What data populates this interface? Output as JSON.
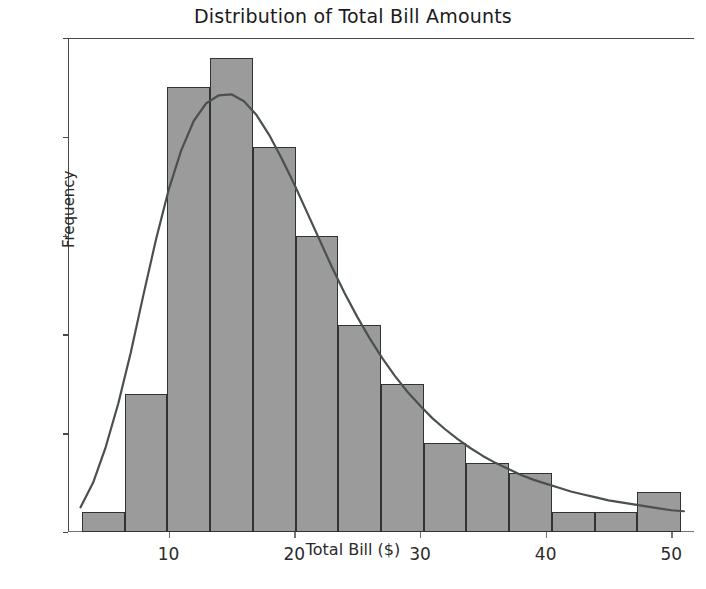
{
  "chart_data": {
    "type": "bar",
    "title": "Distribution of Total Bill Amounts",
    "xlabel": "Total Bill ($)",
    "ylabel": "Frequency",
    "xlim": [
      2.0,
      51.8
    ],
    "ylim": [
      0,
      50
    ],
    "grid": false,
    "legend": null,
    "x_ticks": [
      10,
      20,
      30,
      40,
      50
    ],
    "y_ticks": [
      0,
      10,
      20,
      30,
      40,
      50
    ],
    "bin_edges": [
      3.1,
      6.5,
      9.9,
      13.3,
      16.7,
      20.1,
      23.5,
      26.9,
      30.3,
      33.7,
      37.1,
      40.5,
      43.9,
      47.3,
      50.8
    ],
    "bin_centers": [
      4.8,
      8.2,
      11.6,
      15.0,
      18.4,
      21.8,
      25.2,
      28.6,
      32.0,
      35.4,
      38.8,
      42.2,
      45.6,
      49.0
    ],
    "values": [
      2,
      14,
      45,
      48,
      39,
      30,
      21,
      15,
      9,
      7,
      6,
      2,
      2,
      4
    ],
    "bar_facecolor": "#9b9b9b",
    "bar_edgecolor": "#2f3333",
    "kde": {
      "name": "density curve",
      "color": "#4a5050",
      "x": [
        3.0,
        4.0,
        5.0,
        6.0,
        7.0,
        8.0,
        9.0,
        10.0,
        11.0,
        12.0,
        13.0,
        14.0,
        15.0,
        16.0,
        17.0,
        18.0,
        19.0,
        20.0,
        21.0,
        22.0,
        23.0,
        24.0,
        25.0,
        26.0,
        27.0,
        28.0,
        29.0,
        30.0,
        31.0,
        32.0,
        33.0,
        34.0,
        35.0,
        36.0,
        37.0,
        38.0,
        39.0,
        40.0,
        41.0,
        42.0,
        43.0,
        44.0,
        45.0,
        46.0,
        47.0,
        48.0,
        49.0,
        50.0,
        51.0
      ],
      "y": [
        2.5,
        5.0,
        8.6,
        13.0,
        18.2,
        24.0,
        29.6,
        34.6,
        38.6,
        41.6,
        43.4,
        44.2,
        44.3,
        43.6,
        42.2,
        40.2,
        37.8,
        35.2,
        32.4,
        29.6,
        26.8,
        24.2,
        21.8,
        19.6,
        17.6,
        15.8,
        14.2,
        12.8,
        11.5,
        10.4,
        9.4,
        8.5,
        7.7,
        7.0,
        6.4,
        5.8,
        5.3,
        4.9,
        4.5,
        4.1,
        3.8,
        3.5,
        3.2,
        3.0,
        2.8,
        2.6,
        2.4,
        2.2,
        2.1
      ]
    }
  },
  "axis": {
    "y_tick_labels": [
      "0",
      "10",
      "20",
      "30",
      "40",
      "50"
    ],
    "x_tick_labels": [
      "10",
      "20",
      "30",
      "40",
      "50"
    ]
  }
}
